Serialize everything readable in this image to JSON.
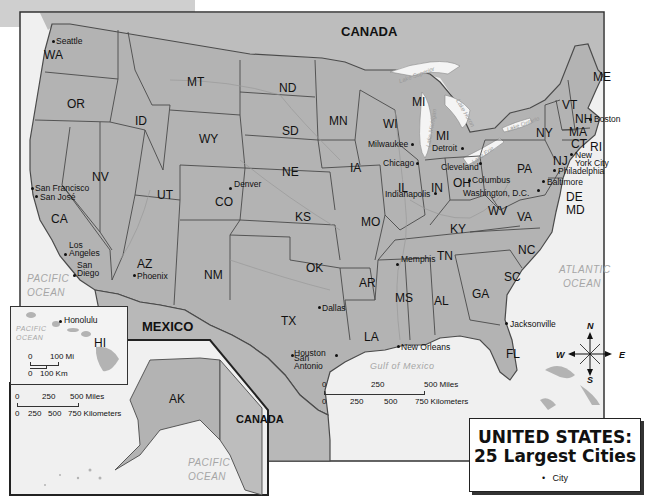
{
  "title": {
    "line1": "UNITED STATES:",
    "line2": "25 Largest Cities"
  },
  "legend": {
    "symbol": "•",
    "label": "City"
  },
  "countries": {
    "canada_top": "CANADA",
    "mexico": "MEXICO",
    "canada_inset": "CANADA"
  },
  "water_bodies": {
    "pacific_main_1": "PACIFIC",
    "pacific_main_2": "OCEAN",
    "atlantic_1": "ATLANTIC",
    "atlantic_2": "OCEAN",
    "gulf": "Gulf  of  Mexico",
    "pacific_hi_1": "PACIFIC",
    "pacific_hi_2": "OCEAN",
    "pacific_ak_1": "PACIFIC",
    "pacific_ak_2": "OCEAN",
    "lake_superior": "Lake Superior",
    "lake_michigan": "Lake Michigan",
    "lake_huron": "Lake Huron",
    "lake_erie": "Lake Erie",
    "lake_ontario": "Lake Ontario"
  },
  "states": [
    {
      "abbr": "WA",
      "x": 44,
      "y": 49
    },
    {
      "abbr": "OR",
      "x": 67,
      "y": 98
    },
    {
      "abbr": "CA",
      "x": 51,
      "y": 213
    },
    {
      "abbr": "NV",
      "x": 92,
      "y": 171
    },
    {
      "abbr": "ID",
      "x": 135,
      "y": 115
    },
    {
      "abbr": "MT",
      "x": 187,
      "y": 76
    },
    {
      "abbr": "WY",
      "x": 199,
      "y": 133
    },
    {
      "abbr": "UT",
      "x": 157,
      "y": 189
    },
    {
      "abbr": "CO",
      "x": 215,
      "y": 196
    },
    {
      "abbr": "AZ",
      "x": 137,
      "y": 258
    },
    {
      "abbr": "NM",
      "x": 204,
      "y": 269
    },
    {
      "abbr": "ND",
      "x": 279,
      "y": 82
    },
    {
      "abbr": "SD",
      "x": 282,
      "y": 125
    },
    {
      "abbr": "NE",
      "x": 282,
      "y": 166
    },
    {
      "abbr": "KS",
      "x": 295,
      "y": 211
    },
    {
      "abbr": "OK",
      "x": 306,
      "y": 262
    },
    {
      "abbr": "TX",
      "x": 281,
      "y": 315
    },
    {
      "abbr": "MN",
      "x": 329,
      "y": 115
    },
    {
      "abbr": "IA",
      "x": 350,
      "y": 162
    },
    {
      "abbr": "MO",
      "x": 361,
      "y": 216
    },
    {
      "abbr": "AR",
      "x": 359,
      "y": 277
    },
    {
      "abbr": "LA",
      "x": 364,
      "y": 331
    },
    {
      "abbr": "WI",
      "x": 383,
      "y": 118
    },
    {
      "abbr": "IL",
      "x": 398,
      "y": 182
    },
    {
      "abbr": "MS",
      "x": 395,
      "y": 292
    },
    {
      "abbr": "MI",
      "x": 412,
      "y": 96
    },
    {
      "abbr": "MI",
      "x": 436,
      "y": 130
    },
    {
      "abbr": "IN",
      "x": 431,
      "y": 182
    },
    {
      "abbr": "OH",
      "x": 453,
      "y": 177
    },
    {
      "abbr": "KY",
      "x": 450,
      "y": 223
    },
    {
      "abbr": "TN",
      "x": 437,
      "y": 250
    },
    {
      "abbr": "AL",
      "x": 434,
      "y": 295
    },
    {
      "abbr": "GA",
      "x": 472,
      "y": 288
    },
    {
      "abbr": "FL",
      "x": 506,
      "y": 348
    },
    {
      "abbr": "SC",
      "x": 504,
      "y": 271
    },
    {
      "abbr": "NC",
      "x": 518,
      "y": 244
    },
    {
      "abbr": "VA",
      "x": 517,
      "y": 211
    },
    {
      "abbr": "WV",
      "x": 488,
      "y": 205
    },
    {
      "abbr": "PA",
      "x": 517,
      "y": 163
    },
    {
      "abbr": "NY",
      "x": 536,
      "y": 127
    },
    {
      "abbr": "VT",
      "x": 562,
      "y": 99
    },
    {
      "abbr": "NH",
      "x": 575,
      "y": 113
    },
    {
      "abbr": "ME",
      "x": 593,
      "y": 71
    },
    {
      "abbr": "MA",
      "x": 569,
      "y": 126
    },
    {
      "abbr": "CT",
      "x": 571,
      "y": 138
    },
    {
      "abbr": "RI",
      "x": 590,
      "y": 141
    },
    {
      "abbr": "NJ",
      "x": 553,
      "y": 155
    },
    {
      "abbr": "DE",
      "x": 566,
      "y": 191
    },
    {
      "abbr": "MD",
      "x": 566,
      "y": 204
    },
    {
      "abbr": "HI",
      "x": 94,
      "y": 337
    },
    {
      "abbr": "AK",
      "x": 169,
      "y": 393
    }
  ],
  "cities": [
    {
      "name": "Seattle",
      "x": 53,
      "y": 41,
      "dx": 3,
      "dy": -4
    },
    {
      "name": "San Francisco",
      "x": 32,
      "y": 188,
      "dx": 3,
      "dy": -4
    },
    {
      "name": "San José",
      "x": 36,
      "y": 196,
      "dx": 4,
      "dy": -3
    },
    {
      "name": "Los Angeles",
      "x": 65,
      "y": 254,
      "dx": 4,
      "dy": -13
    },
    {
      "name": "San Diego",
      "x": 74,
      "y": 275,
      "dx": 3,
      "dy": -14
    },
    {
      "name": "Phoenix",
      "x": 134,
      "y": 275,
      "dx": 3,
      "dy": -3
    },
    {
      "name": "Denver",
      "x": 230,
      "y": 188,
      "dx": 4,
      "dy": -8
    },
    {
      "name": "Dallas",
      "x": 319,
      "y": 307,
      "dx": 3,
      "dy": -3
    },
    {
      "name": "Houston",
      "x": 336,
      "y": 355,
      "dx": -42,
      "dy": -6
    },
    {
      "name": "San Antonio",
      "x": 292,
      "y": 355,
      "dx": 2,
      "dy": -1
    },
    {
      "name": "New Orleans",
      "x": 398,
      "y": 346,
      "dx": 3,
      "dy": -3
    },
    {
      "name": "Memphis",
      "x": 397,
      "y": 264,
      "dx": 4,
      "dy": -9
    },
    {
      "name": "Chicago",
      "x": 417,
      "y": 163,
      "dx": -34,
      "dy": -4
    },
    {
      "name": "Milwaukee",
      "x": 412,
      "y": 144,
      "dx": -44,
      "dy": -4
    },
    {
      "name": "Detroit",
      "x": 462,
      "y": 148,
      "dx": -30,
      "dy": -4
    },
    {
      "name": "Indianapolis",
      "x": 435,
      "y": 193,
      "dx": -50,
      "dy": -3
    },
    {
      "name": "Cleveland",
      "x": 480,
      "y": 163,
      "dx": -39,
      "dy": 0
    },
    {
      "name": "Columbus",
      "x": 469,
      "y": 180,
      "dx": 3,
      "dy": -4
    },
    {
      "name": "Washington, D.C.",
      "x": 538,
      "y": 190,
      "dx": -75,
      "dy": -1
    },
    {
      "name": "Baltimore",
      "x": 543,
      "y": 181,
      "dx": 4,
      "dy": -3
    },
    {
      "name": "Philadelphia",
      "x": 554,
      "y": 170,
      "dx": 4,
      "dy": -3
    },
    {
      "name": "New York City",
      "x": 571,
      "y": 154,
      "dx": 4,
      "dy": -3
    },
    {
      "name": "Boston",
      "x": 590,
      "y": 119,
      "dx": 4,
      "dy": -4
    },
    {
      "name": "Jacksonville",
      "x": 506,
      "y": 323,
      "dx": 4,
      "dy": -3
    },
    {
      "name": "Honolulu",
      "x": 60,
      "y": 321,
      "dx": 4,
      "dy": -5
    }
  ],
  "scales": {
    "main": {
      "miles": [
        "0",
        "250",
        "500 Miles"
      ],
      "km": [
        "0",
        "250",
        "500",
        "750 Kilometers"
      ]
    },
    "alaska": {
      "miles": [
        "0",
        "250",
        "500 Miles"
      ],
      "km": [
        "0",
        "250",
        "500",
        "750 Kilometers"
      ]
    },
    "hawaii": {
      "miles": [
        "0",
        "100 Mi"
      ],
      "km": [
        "0",
        "100 Km"
      ]
    }
  },
  "compass": {
    "n": "N",
    "s": "S",
    "e": "E",
    "w": "W"
  },
  "colors": {
    "land": "#b3b3b3",
    "water": "#ededed",
    "border": "#4a4a4a",
    "river": "#9a9a9a"
  }
}
